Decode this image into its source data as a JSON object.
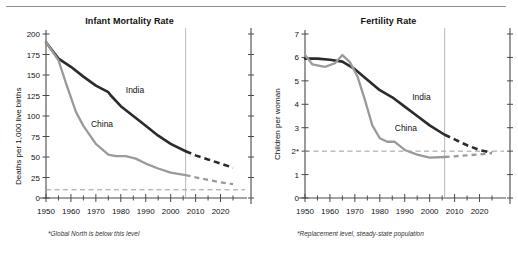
{
  "figure": {
    "background_color": "#ffffff",
    "top_rule_color": "#8d8d8d"
  },
  "colors": {
    "india": "#2b2b2b",
    "china": "#9a9a9a",
    "axis": "#4a4a4a",
    "reference_line": "#9a9a9a",
    "divider_line": "#b0b0b0",
    "text": "#111111"
  },
  "panels": [
    {
      "id": "infant-mortality",
      "title": "Infant Mortality Rate",
      "ylabel": "Deaths per 1,000 live births",
      "footnote": "*Global North is below this level",
      "series_labels": {
        "india": "India",
        "china": "China"
      }
    },
    {
      "id": "fertility",
      "title": "Fertility Rate",
      "ylabel": "Children per woman",
      "footnote": "*Replacement level, steady-state population",
      "series_labels": {
        "india": "India",
        "china": "China"
      }
    }
  ],
  "chart_data": [
    {
      "type": "line",
      "title": "Infant Mortality Rate",
      "xlabel": "",
      "ylabel": "Deaths per 1,000 live births",
      "xlim": [
        1950,
        2025
      ],
      "ylim": [
        0,
        200
      ],
      "xticks": [
        1950,
        1960,
        1970,
        1980,
        1990,
        2000,
        2010,
        2020
      ],
      "xticklabels": [
        "1950",
        "1960",
        "1970",
        "1980",
        "1990",
        "2000",
        "2010",
        "2020"
      ],
      "xminor_step": 5,
      "yticks": [
        0,
        25,
        50,
        75,
        100,
        125,
        150,
        175,
        200
      ],
      "yticklabels": [
        "0",
        "25",
        "50",
        "75",
        "100",
        "125",
        "150",
        "175",
        "200"
      ],
      "grid": false,
      "legend": "inline-labels",
      "reference_line": {
        "value": 10,
        "label": "10*",
        "style": "dashed",
        "note": "Global North is below this level"
      },
      "projection_divider_x": 2006,
      "annotations": [
        {
          "text": "India",
          "x": 1982,
          "y": 128
        },
        {
          "text": "China",
          "x": 1968,
          "y": 86
        },
        {
          "text": "*Global North is below this level",
          "x": 1955,
          "y": -32
        }
      ],
      "series": [
        {
          "name": "India",
          "color": "#2b2b2b",
          "x": [
            1950,
            1955,
            1960,
            1965,
            1970,
            1975,
            1976,
            1980,
            1985,
            1990,
            1995,
            2000,
            2006
          ],
          "values": [
            190,
            170,
            160,
            148,
            137,
            129,
            125,
            112,
            100,
            88,
            76,
            66,
            57
          ],
          "projection": {
            "style": "dashed",
            "x": [
              2006,
              2010,
              2015,
              2020,
              2025
            ],
            "values": [
              57,
              52,
              47,
              42,
              37
            ]
          }
        },
        {
          "name": "China",
          "color": "#9a9a9a",
          "x": [
            1950,
            1955,
            1958,
            1962,
            1965,
            1970,
            1975,
            1978,
            1982,
            1986,
            1990,
            1995,
            2000,
            2006
          ],
          "values": [
            190,
            168,
            140,
            105,
            88,
            66,
            53,
            51,
            51,
            48,
            42,
            36,
            31,
            28
          ],
          "projection": {
            "style": "dashed",
            "x": [
              2006,
              2010,
              2015,
              2020,
              2025
            ],
            "values": [
              28,
              25,
              22,
              19,
              17
            ]
          }
        }
      ]
    },
    {
      "type": "line",
      "title": "Fertility Rate",
      "xlabel": "",
      "ylabel": "Children per woman",
      "xlim": [
        1950,
        2025
      ],
      "ylim": [
        0,
        7
      ],
      "xticks": [
        1950,
        1960,
        1970,
        1980,
        1990,
        2000,
        2010,
        2020
      ],
      "xticklabels": [
        "1950",
        "1960",
        "1970",
        "1980",
        "1990",
        "2000",
        "2010",
        "2020"
      ],
      "xminor_step": 5,
      "yticks": [
        0,
        1,
        2,
        3,
        4,
        5,
        6,
        7
      ],
      "yticklabels": [
        "0",
        "1",
        "2*",
        "3",
        "4",
        "5",
        "6",
        "7"
      ],
      "grid": false,
      "legend": "inline-labels",
      "reference_line": {
        "value": 2,
        "label": "2*",
        "style": "dashed",
        "note": "Replacement level, steady-state population"
      },
      "projection_divider_x": 2006,
      "annotations": [
        {
          "text": "India",
          "x": 1993,
          "y": 4.2
        },
        {
          "text": "China",
          "x": 1986,
          "y": 2.85
        },
        {
          "text": "*Replacement level, steady-state population",
          "x": 1955,
          "y": -1.1
        }
      ],
      "series": [
        {
          "name": "India",
          "color": "#2b2b2b",
          "x": [
            1950,
            1955,
            1960,
            1965,
            1970,
            1975,
            1980,
            1985,
            1990,
            1995,
            2000,
            2006
          ],
          "values": [
            5.95,
            5.95,
            5.9,
            5.82,
            5.5,
            5.05,
            4.6,
            4.3,
            3.9,
            3.5,
            3.1,
            2.7
          ],
          "projection": {
            "style": "dashed",
            "x": [
              2006,
              2010,
              2015,
              2020,
              2025
            ],
            "values": [
              2.7,
              2.5,
              2.25,
              2.05,
              1.92
            ]
          }
        },
        {
          "name": "China",
          "color": "#9a9a9a",
          "x": [
            1950,
            1953,
            1958,
            1962,
            1965,
            1968,
            1971,
            1974,
            1977,
            1980,
            1983,
            1986,
            1990,
            1995,
            2000,
            2006
          ],
          "values": [
            6.1,
            5.7,
            5.6,
            5.75,
            6.1,
            5.8,
            5.2,
            4.2,
            3.1,
            2.55,
            2.4,
            2.4,
            2.05,
            1.85,
            1.72,
            1.75
          ],
          "projection": {
            "style": "dashed",
            "x": [
              2006,
              2010,
              2015,
              2020,
              2025
            ],
            "values": [
              1.75,
              1.78,
              1.82,
              1.86,
              1.92
            ]
          }
        }
      ]
    }
  ]
}
